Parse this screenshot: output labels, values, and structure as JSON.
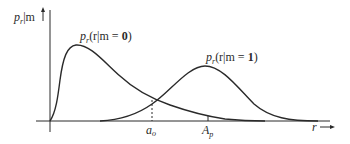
{
  "diagram": {
    "y_axis_label": {
      "main": "p",
      "sub": "r",
      "rest": "|m"
    },
    "x_axis_label": "r",
    "curves": [
      {
        "id": "rlm0",
        "label_p": "p",
        "label_sub": "r",
        "label_paren": "(r|m = ",
        "label_val": "0",
        "label_close": ")"
      },
      {
        "id": "rlm1",
        "label_p": "p",
        "label_sub": "r",
        "label_paren": "(r|m = ",
        "label_val": "1",
        "label_close": ")"
      }
    ],
    "markers": [
      {
        "id": "a_o",
        "main": "a",
        "sub": "o"
      },
      {
        "id": "A_p",
        "main": "A",
        "sub": "p"
      }
    ],
    "colors": {
      "line": "#2a2a2a",
      "background": "#ffffff"
    }
  }
}
